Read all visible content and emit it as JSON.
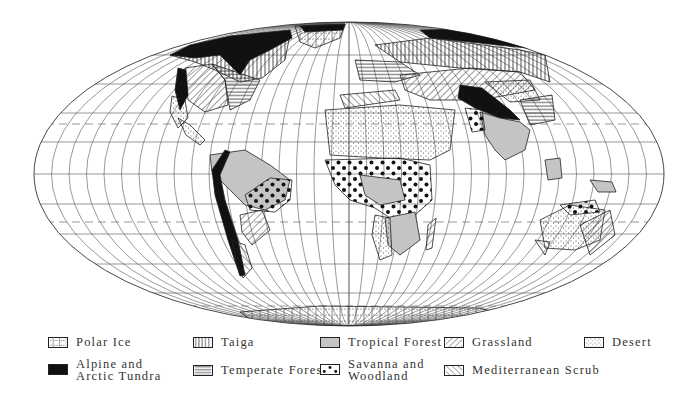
{
  "map": {
    "title": "World Biomes",
    "projection": "elliptical equal-area",
    "colors": {
      "graticule": "#555555",
      "land_outline": "#222222",
      "tropical_forest": "#c4c4c4",
      "tundra": "#111111",
      "background": "#ffffff"
    }
  },
  "legend": {
    "items": [
      {
        "id": "polar-ice",
        "label": "Polar Ice",
        "pattern": "dotted-cross"
      },
      {
        "id": "taiga",
        "label": "Taiga",
        "pattern": "vertical-lines"
      },
      {
        "id": "tropical-forest",
        "label": "Tropical Forest",
        "pattern": "solid-gray"
      },
      {
        "id": "grassland",
        "label": "Grassland",
        "pattern": "diagonal-lines-up"
      },
      {
        "id": "desert",
        "label": "Desert",
        "pattern": "fine-stipple"
      },
      {
        "id": "alpine-tundra",
        "label": "Alpine and\nArctic Tundra",
        "pattern": "solid-black"
      },
      {
        "id": "temperate-forest",
        "label": "Temperate Forest",
        "pattern": "horizontal-lines"
      },
      {
        "id": "savanna",
        "label": "Savanna and\nWoodland",
        "pattern": "large-dots"
      },
      {
        "id": "mediterranean-scrub",
        "label": "Mediterranean Scrub",
        "pattern": "diagonal-lines-down"
      }
    ]
  }
}
